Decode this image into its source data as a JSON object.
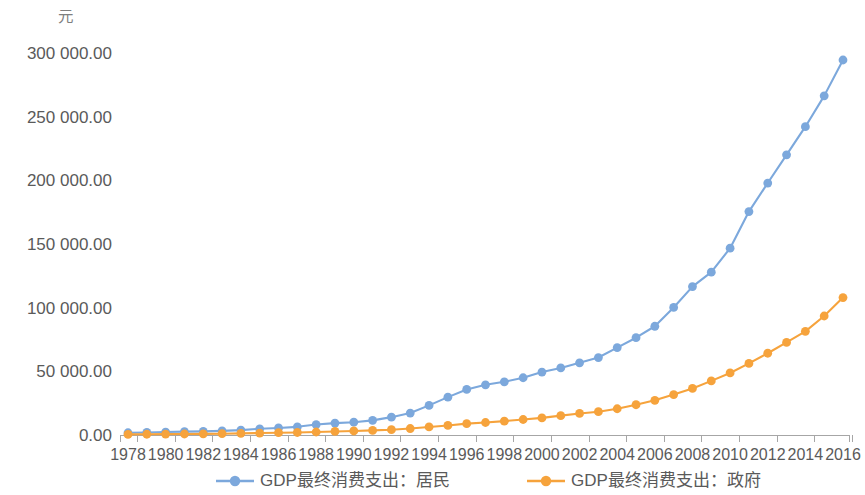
{
  "chart_data": {
    "type": "line",
    "title": "",
    "subtitle": "",
    "xlabel": "",
    "ylabel": "",
    "unit_label": "元",
    "grid": false,
    "legend_position": "bottom",
    "xlim": [
      1978,
      2016
    ],
    "ylim": [
      0,
      300000
    ],
    "y_ticks": [
      0,
      50000,
      100000,
      150000,
      200000,
      250000,
      300000
    ],
    "y_tick_labels": [
      "0.00",
      "50 000.00",
      "100 000.00",
      "150 000.00",
      "200 000.00",
      "250 000.00",
      "300 000.00"
    ],
    "x": [
      1978,
      1979,
      1980,
      1981,
      1982,
      1983,
      1984,
      1985,
      1986,
      1987,
      1988,
      1989,
      1990,
      1991,
      1992,
      1993,
      1994,
      1995,
      1996,
      1997,
      1998,
      1999,
      2000,
      2001,
      2002,
      2003,
      2004,
      2005,
      2006,
      2007,
      2008,
      2009,
      2010,
      2011,
      2012,
      2013,
      2014,
      2015,
      2016
    ],
    "x_tick_labels": [
      "1978",
      "1980",
      "1982",
      "1984",
      "1986",
      "1988",
      "1990",
      "1992",
      "1994",
      "1996",
      "1998",
      "2000",
      "2002",
      "2004",
      "2006",
      "2008",
      "2010",
      "2012",
      "2014",
      "2016"
    ],
    "series": [
      {
        "name": "GDP最终消费支出：居民",
        "color": "#7CA8DC",
        "marker": "circle",
        "values": [
          1759,
          2012,
          2332,
          2628,
          2868,
          3226,
          3861,
          4879,
          5552,
          6416,
          8197,
          9360,
          10056,
          11516,
          14012,
          17218,
          23243,
          29737,
          35795,
          39436,
          41759,
          44969,
          49435,
          52687,
          56674,
          60832,
          68649,
          76410,
          85388,
          100163,
          116554,
          127893,
          146724,
          175484,
          197878,
          220052,
          242124,
          266334,
          294510
        ]
      },
      {
        "name": "GDP最终消费支出：政府",
        "color": "#F6A33C",
        "marker": "circle",
        "values": [
          480,
          596,
          714,
          795,
          911,
          1030,
          1238,
          1531,
          1794,
          1982,
          2351,
          2776,
          3160,
          3619,
          4163,
          5086,
          6326,
          7482,
          8926,
          9816,
          10894,
          12163,
          13424,
          15197,
          16930,
          18289,
          20623,
          23775,
          27222,
          31756,
          36580,
          42500,
          48730,
          56230,
          64220,
          72700,
          81420,
          93450,
          107900
        ]
      }
    ]
  },
  "legend": {
    "items": [
      {
        "label": "GDP最终消费支出：居民",
        "color": "#7CA8DC"
      },
      {
        "label": "GDP最终消费支出：政府",
        "color": "#F6A33C"
      }
    ]
  }
}
